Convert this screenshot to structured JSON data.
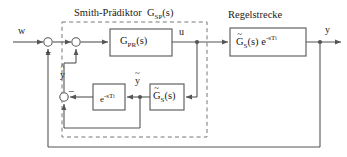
{
  "diagram": {
    "type": "control-block-diagram",
    "name": "Smith-Prädiktor Regelkreis",
    "groups": [
      {
        "id": "smith_predictor",
        "title": "Smith-Prädiktor",
        "transfer": "G",
        "transfer_sub": "SP",
        "transfer_arg": "(s)",
        "border": "dashed"
      },
      {
        "id": "plant_group",
        "title": "Regelstrecke",
        "border": "none"
      }
    ],
    "blocks": [
      {
        "id": "controller",
        "base": "G",
        "sub": "PR",
        "arg": "(s)",
        "accent": "none",
        "extra": ""
      },
      {
        "id": "plant",
        "base": "G",
        "sub": "S",
        "arg": "(s)",
        "accent": "tilde",
        "extra": "e",
        "extra_sup": "-sT",
        "extra_sup_sub": "t"
      },
      {
        "id": "model",
        "base": "G",
        "sub": "S",
        "arg": "(s)",
        "accent": "tilde",
        "extra": ""
      },
      {
        "id": "delay",
        "base": "e",
        "sup": "-sT",
        "sup_sub": "t",
        "accent": "none"
      }
    ],
    "signals": [
      {
        "id": "reference",
        "label": "w"
      },
      {
        "id": "control",
        "label": "u"
      },
      {
        "id": "output",
        "label": "y"
      },
      {
        "id": "model_output_hat",
        "label": "y",
        "accent": "hat"
      },
      {
        "id": "model_output_tilde",
        "label": "y",
        "accent": "tilde"
      }
    ],
    "junctions": [
      {
        "id": "outer-sum",
        "sign": "-"
      },
      {
        "id": "inner-sum",
        "sign": "-"
      },
      {
        "id": "model-error-sum",
        "sign": "-"
      }
    ],
    "colors": {
      "line": "#555555",
      "block_border": "#555555",
      "dashed_border": "#777777",
      "text": "#1a1a1a",
      "background": "#ffffff"
    }
  }
}
